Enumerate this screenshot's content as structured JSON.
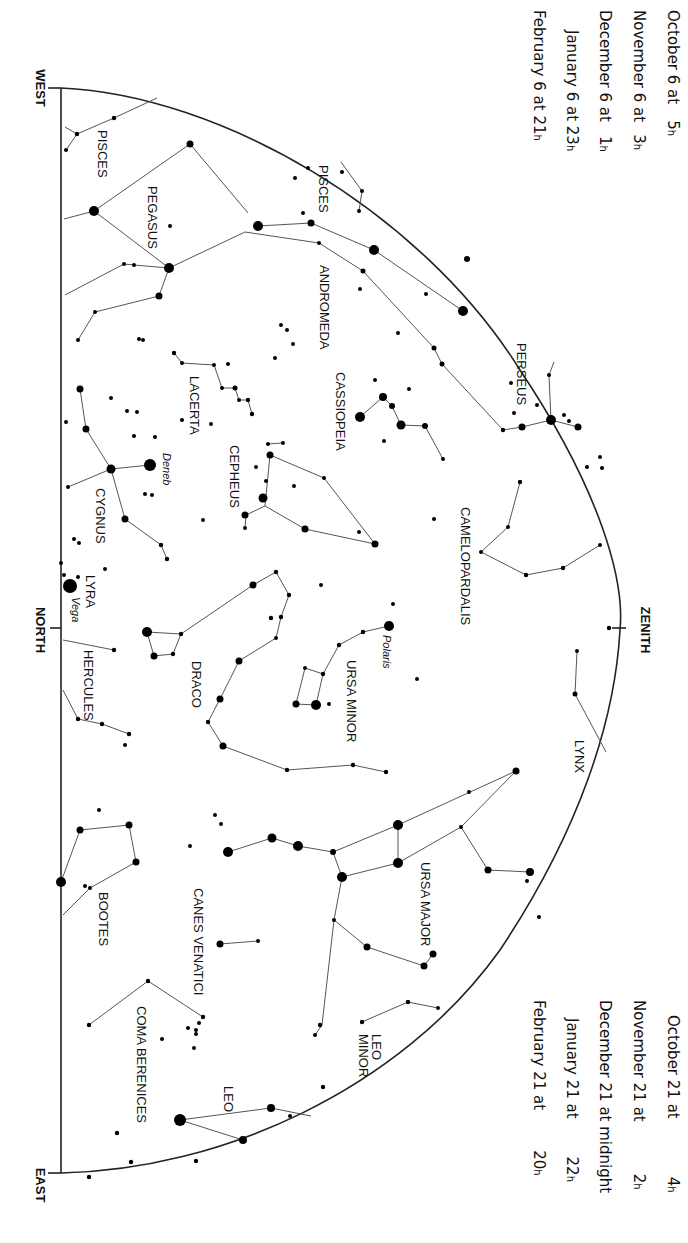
{
  "directions": {
    "west": "WEST",
    "north": "NORTH",
    "east": "EAST",
    "zenith": "ZENITH"
  },
  "times_top": [
    {
      "date": "October 6 at",
      "hour": "5",
      "unit": "h"
    },
    {
      "date": "November 6 at",
      "hour": "3",
      "unit": "h"
    },
    {
      "date": "December 6 at",
      "hour": "1",
      "unit": "h"
    },
    {
      "date": "January 6 at 23",
      "hour": "",
      "unit": "h"
    },
    {
      "date": "February 6 at 21",
      "hour": "",
      "unit": "h"
    }
  ],
  "times_bottom": [
    {
      "date": "October 21 at",
      "hour": "4",
      "unit": "h"
    },
    {
      "date": "November 21 at",
      "hour": "2",
      "unit": "h"
    },
    {
      "date": "December 21 at midnight",
      "hour": "",
      "unit": ""
    },
    {
      "date": "January 21 at",
      "hour": "22",
      "unit": "h"
    },
    {
      "date": "February 21 at",
      "hour": "20",
      "unit": "h"
    }
  ],
  "constellations": {
    "pisces_1": "PISCES",
    "pisces_2": "PISCES",
    "pegasus": "PEGASUS",
    "andromeda": "ANDROMEDA",
    "perseus": "PERSEUS",
    "cassiopeia": "CASSIOPEIA",
    "lacerta": "LACERTA",
    "cepheus": "CEPHEUS",
    "cygnus": "CYGNUS",
    "camelopardalis": "CAMELOPARDALIS",
    "lyra": "LYRA",
    "hercules": "HERCULES",
    "draco": "DRACO",
    "ursa_minor": "URSA MINOR",
    "lynx": "LYNX",
    "ursa_major": "URSA MAJOR",
    "bootes": "BOOTES",
    "canes_venatici": "CANES VENATICI",
    "coma_berenices": "COMA BERENICES",
    "leo_minor_1": "LEO",
    "leo_minor_2": "MINOR",
    "leo": "LEO"
  },
  "stars": {
    "deneb": "Deneb",
    "vega": "Vega",
    "polaris": "Polaris"
  }
}
